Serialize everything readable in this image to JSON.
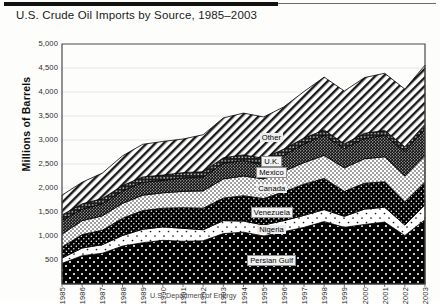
{
  "header": {
    "title": "U.S. Crude Oil Imports by Source, 1985–2003"
  },
  "footer": {
    "source_note": "U.S. Department of Energy"
  },
  "axes": {
    "ylabel": "Millions of Barrels",
    "yticks": [
      "5,000",
      "4,500",
      "4,000",
      "3,500",
      "3,000",
      "2,500",
      "2,000",
      "1,500",
      "1,000",
      "500"
    ],
    "ytick_values": [
      5000,
      4500,
      4000,
      3500,
      3000,
      2500,
      2000,
      1500,
      1000,
      500
    ],
    "xticks": [
      "1985",
      "1986",
      "1987",
      "1988",
      "1989",
      "1990",
      "1991",
      "1992",
      "1993",
      "1994",
      "1995",
      "1996",
      "1997",
      "1998",
      "1999",
      "2000",
      "2001",
      "2002",
      "2003"
    ]
  },
  "chart_data": {
    "type": "area",
    "title": "U.S. Crude Oil Imports by Source, 1985–2003",
    "xlabel": "",
    "ylabel": "Millions of Barrels",
    "ylim": [
      0,
      5000
    ],
    "xlim": [
      "1985",
      "2003"
    ],
    "grid": true,
    "legend": "inline-labels",
    "stacked": true,
    "categories": [
      "1985",
      "1986",
      "1987",
      "1988",
      "1989",
      "1990",
      "1991",
      "1992",
      "1993",
      "1994",
      "1995",
      "1996",
      "1997",
      "1998",
      "1999",
      "2000",
      "2001",
      "2002",
      "2003"
    ],
    "series": [
      {
        "name": "Persian Gulf",
        "fill": "black-white-dots",
        "values": [
          430,
          590,
          640,
          790,
          860,
          910,
          890,
          900,
          1050,
          1080,
          1000,
          1090,
          1180,
          1300,
          1180,
          1240,
          1290,
          1010,
          1340
        ]
      },
      {
        "name": "Nigeria",
        "fill": "white-sparse-dots",
        "values": [
          110,
          160,
          180,
          220,
          280,
          280,
          270,
          230,
          270,
          230,
          230,
          230,
          250,
          250,
          230,
          320,
          310,
          220,
          310
        ]
      },
      {
        "name": "Venezuela",
        "fill": "black-fine-dots",
        "values": [
          230,
          280,
          300,
          360,
          390,
          390,
          430,
          450,
          470,
          530,
          550,
          600,
          650,
          650,
          520,
          540,
          530,
          480,
          470
        ]
      },
      {
        "name": "Canada",
        "fill": "white-fine-dots",
        "values": [
          270,
          290,
          300,
          310,
          320,
          320,
          340,
          360,
          400,
          410,
          410,
          430,
          450,
          480,
          490,
          510,
          520,
          540,
          560
        ]
      },
      {
        "name": "Mexico",
        "fill": "dense-crosshatch",
        "values": [
          290,
          240,
          250,
          260,
          270,
          260,
          280,
          290,
          330,
          320,
          300,
          330,
          390,
          420,
          400,
          420,
          450,
          510,
          560
        ]
      },
      {
        "name": "U.K.",
        "fill": "dark-dots",
        "values": [
          110,
          110,
          110,
          110,
          110,
          110,
          110,
          110,
          110,
          120,
          130,
          130,
          120,
          110,
          100,
          110,
          100,
          100,
          90
        ]
      },
      {
        "name": "Other",
        "fill": "diagonal-hatch",
        "values": [
          410,
          450,
          530,
          620,
          680,
          700,
          700,
          770,
          830,
          870,
          860,
          880,
          970,
          1100,
          1100,
          1160,
          1190,
          1200,
          1230
        ]
      }
    ],
    "totals": [
      1850,
      2120,
      2310,
      2670,
      2910,
      2970,
      3020,
      3110,
      3460,
      3560,
      3480,
      3690,
      4010,
      4310,
      4020,
      4300,
      4390,
      4060,
      4560
    ]
  },
  "series_labels": [
    {
      "name": "Other",
      "style": "plain"
    },
    {
      "name": "U.K.",
      "style": "boxed"
    },
    {
      "name": "Mexico",
      "style": "boxed"
    },
    {
      "name": "Canada",
      "style": "plain"
    },
    {
      "name": "Venezuela",
      "style": "boxed"
    },
    {
      "name": "Nigeria",
      "style": "plain"
    },
    {
      "name": "Persian Gulf",
      "style": "boxed"
    }
  ]
}
